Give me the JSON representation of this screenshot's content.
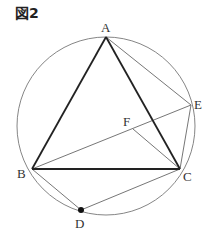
{
  "figure": {
    "title": "図2"
  },
  "points": {
    "A": {
      "label": "A",
      "x": 106,
      "y": 37,
      "lx": 101,
      "ly": 32
    },
    "B": {
      "label": "B",
      "x": 32,
      "y": 169,
      "lx": 17,
      "ly": 178
    },
    "C": {
      "label": "C",
      "x": 180,
      "y": 169,
      "lx": 183,
      "ly": 181
    },
    "D": {
      "label": "D",
      "x": 81,
      "y": 210,
      "lx": 75,
      "ly": 228
    },
    "E": {
      "label": "E",
      "x": 191,
      "y": 105,
      "lx": 194,
      "ly": 109
    },
    "F": {
      "label": "F",
      "x": 133,
      "y": 129,
      "lx": 123,
      "ly": 126
    }
  },
  "circle": {
    "cx": 106,
    "cy": 126,
    "r": 89
  },
  "segments": {
    "thick": [
      [
        "A",
        "B"
      ],
      [
        "A",
        "C"
      ],
      [
        "B",
        "C"
      ]
    ],
    "thin": [
      [
        "A",
        "E"
      ],
      [
        "B",
        "E"
      ],
      [
        "E",
        "C"
      ],
      [
        "F",
        "C"
      ],
      [
        "B",
        "D"
      ],
      [
        "D",
        "C"
      ]
    ]
  },
  "colors": {
    "thick": "#222222",
    "thin": "#666666",
    "circle": "#777777",
    "point": "#111111"
  }
}
